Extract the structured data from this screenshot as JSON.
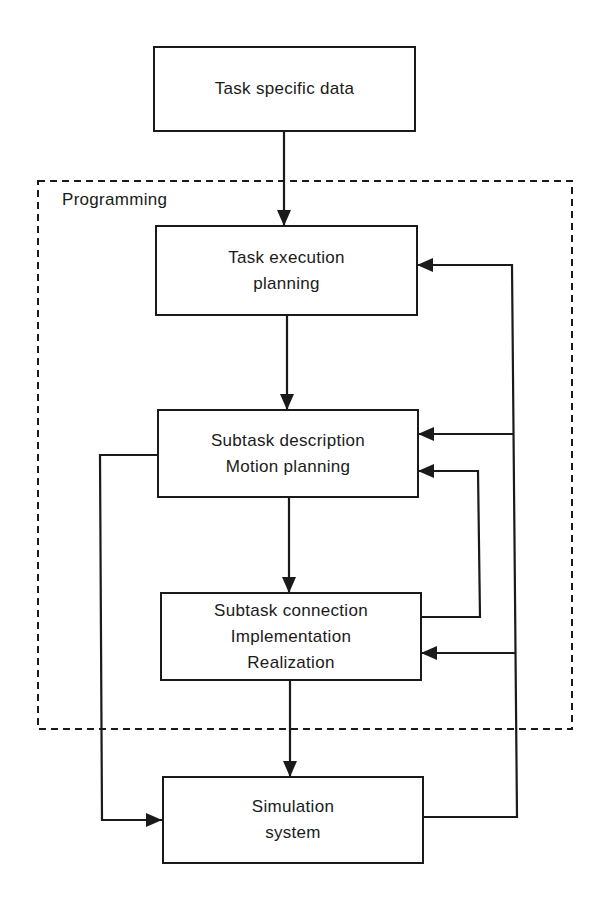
{
  "diagram": {
    "type": "flowchart",
    "group": {
      "label": "Programming",
      "style": "dashed"
    },
    "nodes": [
      {
        "id": "task_data",
        "lines": [
          "Task specific data"
        ]
      },
      {
        "id": "task_exec",
        "lines": [
          "Task execution",
          "planning"
        ]
      },
      {
        "id": "subtask_desc",
        "lines": [
          "Subtask description",
          "Motion planning"
        ]
      },
      {
        "id": "subtask_conn",
        "lines": [
          "Subtask connection",
          "Implementation",
          "Realization"
        ]
      },
      {
        "id": "simulation",
        "lines": [
          "Simulation",
          "system"
        ]
      }
    ],
    "edges": [
      {
        "from": "Task specific data",
        "to": "Task execution planning"
      },
      {
        "from": "Task execution planning",
        "to": "Subtask description / Motion planning"
      },
      {
        "from": "Subtask description / Motion planning",
        "to": "Subtask connection / Implementation / Realization"
      },
      {
        "from": "Subtask connection / Implementation / Realization",
        "to": "Simulation system"
      },
      {
        "from": "Subtask description / Motion planning",
        "to": "Simulation system"
      },
      {
        "from": "Subtask connection / Implementation / Realization",
        "to": "Subtask description / Motion planning"
      },
      {
        "from": "Simulation system",
        "to": "Task execution planning"
      },
      {
        "from": "Simulation system",
        "to": "Subtask description / Motion planning"
      },
      {
        "from": "Simulation system",
        "to": "Subtask connection / Implementation / Realization"
      }
    ],
    "colors": {
      "line": "#1a1a1a",
      "background": "#ffffff"
    }
  }
}
